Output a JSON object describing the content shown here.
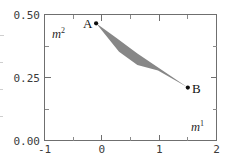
{
  "chart_data": {
    "type": "scatter",
    "title": "",
    "subtitle": "",
    "xlabel": "m1",
    "ylabel": "m2",
    "xlabel_base": "m",
    "xlabel_sup": "1",
    "ylabel_base": "m",
    "ylabel_sup": "2",
    "xlim": [
      -1,
      2
    ],
    "ylim": [
      0.0,
      0.5
    ],
    "grid": false,
    "legend": "none",
    "x_ticks": [
      -1,
      0,
      1,
      2
    ],
    "x_tick_labels": [
      "-1",
      "0",
      "1",
      "2"
    ],
    "x_minor_ticks": [
      -0.5,
      0.5,
      1.5
    ],
    "y_ticks": [
      0.0,
      0.25,
      0.5
    ],
    "y_tick_labels": [
      "0.00",
      "0.25",
      "0.50"
    ],
    "y_minor_ticks": [
      0.125,
      0.375
    ],
    "points": [
      {
        "name": "A",
        "label": "A",
        "x": -0.1,
        "y": 0.465,
        "label_side": "left"
      },
      {
        "name": "B",
        "label": "B",
        "x": 1.5,
        "y": 0.21,
        "label_side": "right"
      }
    ],
    "regions": [
      {
        "name": "admissible-region",
        "kind": "polygon",
        "fill_color": "#878787",
        "vertices": [
          [
            -0.1,
            0.465
          ],
          [
            0.25,
            0.408
          ],
          [
            0.62,
            0.345
          ],
          [
            1.5,
            0.21
          ],
          [
            0.98,
            0.278
          ],
          [
            0.62,
            0.3
          ],
          [
            0.3,
            0.352
          ]
        ]
      }
    ],
    "annotations": [
      {
        "name": "point-a-label",
        "text": "A",
        "x": -0.1,
        "y": 0.465
      },
      {
        "name": "point-b-label",
        "text": "B",
        "x": 1.5,
        "y": 0.21
      }
    ],
    "colors": {
      "region_fill": "#878787",
      "marker": "#0d0d0d",
      "axis": "#6f6f6f",
      "tick_text": "#3b3b3b",
      "background": "#ffffff"
    }
  }
}
